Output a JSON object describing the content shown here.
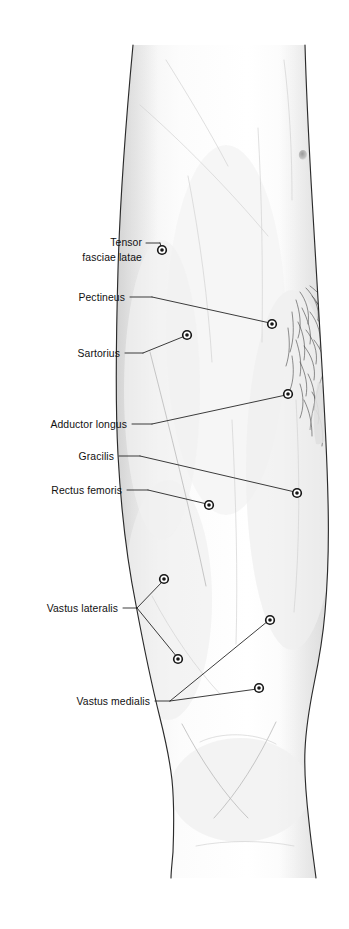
{
  "figure": {
    "kind": "anatomical-illustration",
    "background_color": "#ffffff",
    "ink_color": "#1a1a1a",
    "skin_fill_color": "#fbfbfb",
    "shadow_color": "#e3e3e3",
    "width": 349,
    "height": 929
  },
  "labels": [
    {
      "id": "tensor-fasciae-latae",
      "lines": [
        "Tensor",
        "fasciae latae"
      ],
      "text_x": 142,
      "text_y": 246,
      "line_height": 15,
      "align": "end",
      "dash_from_x": 146,
      "dash_from_y": 243,
      "dash_to_x": 160,
      "dash_to_y": 243,
      "leader": "M160,243 L162,249",
      "markers": [
        {
          "x": 162,
          "y": 250
        }
      ]
    },
    {
      "id": "pectineus",
      "lines": [
        "Pectineus"
      ],
      "text_x": 125,
      "text_y": 301,
      "line_height": 15,
      "align": "end",
      "dash_from_x": 130,
      "dash_from_y": 297,
      "dash_to_x": 152,
      "dash_to_y": 297,
      "leader": "M152,297 L270,323",
      "markers": [
        {
          "x": 272,
          "y": 324
        }
      ]
    },
    {
      "id": "sartorius",
      "lines": [
        "Sartorius"
      ],
      "text_x": 120,
      "text_y": 357,
      "line_height": 15,
      "align": "end",
      "dash_from_x": 125,
      "dash_from_y": 353,
      "dash_to_x": 143,
      "dash_to_y": 353,
      "leader": "M143,353 L185,336",
      "markers": [
        {
          "x": 187,
          "y": 335
        }
      ]
    },
    {
      "id": "adductor-longus",
      "lines": [
        "Adductor longus"
      ],
      "text_x": 127,
      "text_y": 428,
      "line_height": 15,
      "align": "end",
      "dash_from_x": 132,
      "dash_from_y": 424,
      "dash_to_x": 152,
      "dash_to_y": 424,
      "leader": "M152,424 L286,395",
      "markers": [
        {
          "x": 288,
          "y": 394
        }
      ]
    },
    {
      "id": "gracilis",
      "lines": [
        "Gracilis"
      ],
      "text_x": 114,
      "text_y": 460,
      "line_height": 15,
      "align": "end",
      "dash_from_x": 119,
      "dash_from_y": 456,
      "dash_to_x": 140,
      "dash_to_y": 456,
      "leader": "M140,456 L295,492",
      "markers": [
        {
          "x": 297,
          "y": 493
        }
      ]
    },
    {
      "id": "rectus-femoris",
      "lines": [
        "Rectus femoris"
      ],
      "text_x": 122,
      "text_y": 494,
      "line_height": 15,
      "align": "end",
      "dash_from_x": 127,
      "dash_from_y": 490,
      "dash_to_x": 148,
      "dash_to_y": 490,
      "leader": "M148,490 L207,504",
      "markers": [
        {
          "x": 209,
          "y": 505
        }
      ]
    },
    {
      "id": "vastus-lateralis",
      "lines": [
        "Vastus lateralis"
      ],
      "text_x": 118,
      "text_y": 612,
      "line_height": 15,
      "align": "end",
      "dash_from_x": 123,
      "dash_from_y": 608,
      "dash_to_x": 137,
      "dash_to_y": 608,
      "leader": "M137,608 L163,581 M137,608 L177,657",
      "markers": [
        {
          "x": 164,
          "y": 579
        },
        {
          "x": 178,
          "y": 659
        }
      ]
    },
    {
      "id": "vastus-medialis",
      "lines": [
        "Vastus medialis"
      ],
      "text_x": 150,
      "text_y": 705,
      "line_height": 15,
      "align": "end",
      "dash_from_x": 155,
      "dash_from_y": 701,
      "dash_to_x": 170,
      "dash_to_y": 701,
      "leader": "M170,701 L268,621 M170,701 L257,689",
      "markers": [
        {
          "x": 270,
          "y": 620
        },
        {
          "x": 259,
          "y": 688
        }
      ]
    }
  ],
  "skin_marks": [
    {
      "id": "mole-upper-lateral",
      "x": 303,
      "y": 155,
      "rx": 4.2,
      "ry": 5.0
    }
  ]
}
